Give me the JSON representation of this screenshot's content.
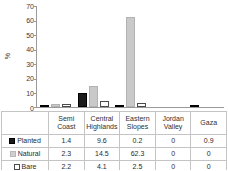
{
  "chart_data": {
    "type": "bar",
    "title": "",
    "xlabel": "",
    "ylabel": "%",
    "ylim": [
      0,
      70
    ],
    "yticks": [
      0,
      10,
      20,
      30,
      40,
      50,
      60,
      70
    ],
    "grid": false,
    "legend_position": "table-row-labels",
    "categories": [
      "Semi Coast",
      "Central Highlands",
      "Eastern Slopes",
      "Jordan Valley",
      "Gaza"
    ],
    "category_lines": [
      [
        "Semi",
        "Coast"
      ],
      [
        "Central",
        "Highlands"
      ],
      [
        "Eastern",
        "Slopes"
      ],
      [
        "Jordan",
        "Valley"
      ],
      [
        "Gaza",
        ""
      ]
    ],
    "series": [
      {
        "name": "Planted",
        "color": "#1b1b1b",
        "values": [
          1.4,
          9.6,
          0.2,
          0,
          0.9
        ],
        "labels": [
          "1.4",
          "9.6",
          "0.2",
          "0",
          "0.9"
        ]
      },
      {
        "name": "Natural",
        "color": "#c9c9c9",
        "values": [
          2.3,
          14.5,
          62.3,
          0,
          0
        ],
        "labels": [
          "2.3",
          "14.5",
          "62.3",
          "0",
          "0"
        ]
      },
      {
        "name": "Bare",
        "color": "#ffffff",
        "values": [
          2.2,
          4.1,
          2.5,
          0,
          0
        ],
        "labels": [
          "2.2",
          "4.1",
          "2.5",
          "0",
          "0"
        ]
      }
    ]
  },
  "axis": {
    "y_title": "%",
    "ticks": [
      "70",
      "60",
      "50",
      "40",
      "30",
      "20",
      "10",
      "0"
    ]
  },
  "table": {
    "header": [
      "",
      "Semi Coast",
      "Central Highlands",
      "Eastern Slopes",
      "Jordan Valley",
      "Gaza"
    ],
    "rows": [
      {
        "label": "Planted",
        "swatch": "planted-swatch-icon",
        "cells": [
          "1.4",
          "9.6",
          "0.2",
          "0",
          "0.9"
        ]
      },
      {
        "label": "Natural",
        "swatch": "natural-swatch-icon",
        "cells": [
          "2.3",
          "14.5",
          "62.3",
          "0",
          "0"
        ]
      },
      {
        "label": "Bare",
        "swatch": "bare-swatch-icon",
        "cells": [
          "2.2",
          "4.1",
          "2.5",
          "0",
          "0"
        ]
      }
    ]
  }
}
